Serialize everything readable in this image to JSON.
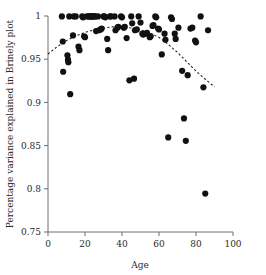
{
  "chart_data": {
    "type": "scatter",
    "title": "",
    "xlabel": "Age",
    "ylabel": "Percentage variance explained in Brinely plot",
    "xlim": [
      0,
      100
    ],
    "ylim": [
      0.75,
      1.0
    ],
    "xticks": [
      0,
      20,
      40,
      60,
      80,
      100
    ],
    "yticks": [
      0.75,
      0.8,
      0.85,
      0.9,
      0.95,
      1
    ],
    "xtick_labels": [
      "0",
      "20",
      "40",
      "60",
      "80",
      "100"
    ],
    "ytick_labels": [
      "0.75",
      "0.8",
      "0.85",
      "0.9",
      "0.95",
      "1"
    ],
    "grid": false,
    "legend": null,
    "marker": "filled-circle",
    "marker_color": "#111111",
    "points": [
      [
        7.5,
        0.9995
      ],
      [
        8.0,
        0.9705
      ],
      [
        8.2,
        0.9355
      ],
      [
        10.5,
        0.9545
      ],
      [
        10.8,
        0.9495
      ],
      [
        11.0,
        0.9465
      ],
      [
        11.5,
        0.9995
      ],
      [
        12.0,
        0.9095
      ],
      [
        13.5,
        0.9775
      ],
      [
        14.0,
        0.9995
      ],
      [
        15.0,
        0.9995
      ],
      [
        16.5,
        0.9645
      ],
      [
        17.0,
        0.9605
      ],
      [
        18.5,
        0.9995
      ],
      [
        19.0,
        0.9985
      ],
      [
        19.5,
        0.9765
      ],
      [
        20.0,
        0.9755
      ],
      [
        21.0,
        0.9995
      ],
      [
        22.0,
        0.9995
      ],
      [
        22.5,
        0.9995
      ],
      [
        23.0,
        0.9995
      ],
      [
        23.5,
        0.9995
      ],
      [
        24.0,
        0.9995
      ],
      [
        24.5,
        0.9995
      ],
      [
        25.0,
        0.9995
      ],
      [
        25.5,
        0.9995
      ],
      [
        26.0,
        0.9825
      ],
      [
        27.0,
        0.9995
      ],
      [
        27.5,
        0.9835
      ],
      [
        28.5,
        0.9845
      ],
      [
        29.0,
        0.9855
      ],
      [
        30.0,
        0.9995
      ],
      [
        30.5,
        0.9995
      ],
      [
        31.0,
        0.9985
      ],
      [
        32.0,
        0.9735
      ],
      [
        32.5,
        0.9605
      ],
      [
        33.5,
        0.9995
      ],
      [
        34.0,
        0.9995
      ],
      [
        36.0,
        0.9995
      ],
      [
        36.5,
        0.9835
      ],
      [
        37.5,
        0.9865
      ],
      [
        38.0,
        0.9875
      ],
      [
        39.5,
        0.9995
      ],
      [
        40.0,
        0.9985
      ],
      [
        41.0,
        0.9865
      ],
      [
        41.5,
        0.9875
      ],
      [
        42.5,
        0.9745
      ],
      [
        44.0,
        0.9255
      ],
      [
        46.5,
        0.9275
      ],
      [
        45.0,
        0.9995
      ],
      [
        45.5,
        0.9915
      ],
      [
        47.0,
        0.9835
      ],
      [
        48.0,
        0.9845
      ],
      [
        49.0,
        0.9995
      ],
      [
        50.0,
        0.9925
      ],
      [
        51.0,
        0.9795
      ],
      [
        51.5,
        0.9785
      ],
      [
        53.0,
        0.9795
      ],
      [
        53.5,
        0.9805
      ],
      [
        55.0,
        0.9755
      ],
      [
        55.5,
        0.9765
      ],
      [
        56.5,
        0.9885
      ],
      [
        57.0,
        0.9895
      ],
      [
        58.0,
        0.9995
      ],
      [
        58.5,
        0.9985
      ],
      [
        59.5,
        0.9855
      ],
      [
        60.0,
        0.9845
      ],
      [
        61.5,
        0.9555
      ],
      [
        63.0,
        0.9795
      ],
      [
        63.5,
        0.9725
      ],
      [
        65.0,
        0.8595
      ],
      [
        66.5,
        0.9985
      ],
      [
        67.0,
        0.9965
      ],
      [
        68.5,
        0.9795
      ],
      [
        69.0,
        0.9735
      ],
      [
        70.5,
        0.9865
      ],
      [
        72.5,
        0.9365
      ],
      [
        73.5,
        0.8815
      ],
      [
        74.5,
        0.8555
      ],
      [
        75.5,
        0.9315
      ],
      [
        77.0,
        0.9855
      ],
      [
        78.0,
        0.9865
      ],
      [
        79.5,
        0.9715
      ],
      [
        80.0,
        0.9695
      ],
      [
        82.5,
        0.9995
      ],
      [
        84.0,
        0.9175
      ],
      [
        85.0,
        0.7945
      ],
      [
        86.5,
        0.9835
      ]
    ],
    "trend": {
      "style": "dashed",
      "description": "quadratic fit peaking near age 38",
      "points": [
        [
          0,
          0.956
        ],
        [
          5,
          0.9645
        ],
        [
          10,
          0.9715
        ],
        [
          15,
          0.977
        ],
        [
          20,
          0.981
        ],
        [
          25,
          0.984
        ],
        [
          30,
          0.9862
        ],
        [
          35,
          0.9875
        ],
        [
          40,
          0.9872
        ],
        [
          45,
          0.9862
        ],
        [
          50,
          0.984
        ],
        [
          55,
          0.9805
        ],
        [
          60,
          0.9752
        ],
        [
          65,
          0.9672
        ],
        [
          70,
          0.9578
        ],
        [
          75,
          0.947
        ],
        [
          80,
          0.9362
        ],
        [
          85,
          0.9268
        ],
        [
          90,
          0.918
        ]
      ]
    }
  }
}
